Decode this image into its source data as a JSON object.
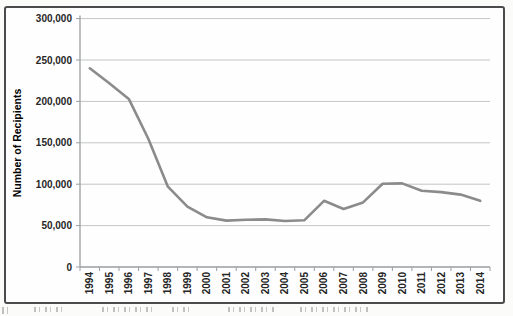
{
  "chart_data": {
    "type": "line",
    "ylabel": "Number of Recipients",
    "xlabel": "",
    "categories": [
      "1994",
      "1995",
      "1996",
      "1997",
      "1998",
      "1999",
      "2000",
      "2001",
      "2002",
      "2003",
      "2004",
      "2005",
      "2006",
      "2007",
      "2008",
      "2009",
      "2010",
      "2011",
      "2012",
      "2013",
      "2014"
    ],
    "series": [
      {
        "name": "Number of Recipients",
        "values": [
          240000,
          222000,
          203000,
          155000,
          97000,
          73000,
          60000,
          56000,
          57000,
          57500,
          55500,
          56500,
          80000,
          70000,
          78000,
          100500,
          101000,
          92000,
          90500,
          87500,
          80000
        ]
      }
    ],
    "ylim": [
      0,
      300000
    ],
    "y_tick_step": 50000,
    "y_tick_labels": [
      "0",
      "50,000",
      "100,000",
      "150,000",
      "200,000",
      "250,000",
      "300,000"
    ],
    "x_tick_label_rotation": -90,
    "grid": "horizontal",
    "legend": "none",
    "colors": {
      "line": "#8b8b8b",
      "gridline": "#c3c5c6",
      "axis": "#9a9ea0",
      "tick_label": "#262626",
      "axis_title": "#121212",
      "frame_border": "#4b4b4d",
      "plot_background": "#fefefe"
    }
  }
}
